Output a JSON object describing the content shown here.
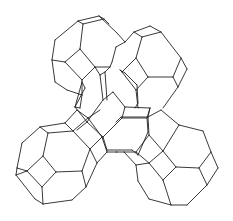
{
  "diagram": {
    "type": "line-drawing",
    "stroke_color": "#222222",
    "background": "#ffffff",
    "cages": [
      {
        "name": "top-left-cage",
        "position": "top-left"
      },
      {
        "name": "top-right-cage",
        "position": "top-right"
      },
      {
        "name": "bottom-left-cage",
        "position": "bottom-left"
      },
      {
        "name": "bottom-right-cage",
        "position": "bottom-right"
      }
    ],
    "segments": [
      [
        78,
        21,
        99,
        16
      ],
      [
        99,
        16,
        117,
        33
      ],
      [
        78,
        21,
        83,
        24
      ],
      [
        83,
        24,
        104,
        19
      ],
      [
        104,
        19,
        109,
        24
      ],
      [
        99,
        16,
        104,
        19
      ],
      [
        78,
        21,
        55,
        40
      ],
      [
        55,
        40,
        52,
        60
      ],
      [
        52,
        60,
        55,
        82
      ],
      [
        55,
        82,
        67,
        90
      ],
      [
        67,
        90,
        82,
        95
      ],
      [
        83,
        24,
        80,
        49
      ],
      [
        80,
        49,
        65,
        62
      ],
      [
        65,
        62,
        52,
        60
      ],
      [
        80,
        49,
        95,
        67
      ],
      [
        65,
        62,
        82,
        80
      ],
      [
        82,
        80,
        82,
        95
      ],
      [
        82,
        80,
        95,
        67
      ],
      [
        95,
        67,
        110,
        67
      ],
      [
        110,
        67,
        105,
        72
      ],
      [
        95,
        67,
        100,
        75
      ],
      [
        100,
        75,
        105,
        72
      ],
      [
        105,
        72,
        107,
        100
      ],
      [
        100,
        75,
        103,
        100
      ],
      [
        117,
        33,
        125,
        42
      ],
      [
        82,
        95,
        80,
        108
      ],
      [
        80,
        108,
        75,
        107
      ],
      [
        134,
        32,
        150,
        26
      ],
      [
        150,
        26,
        161,
        32
      ],
      [
        161,
        32,
        142,
        37
      ],
      [
        142,
        37,
        134,
        32
      ],
      [
        134,
        32,
        125,
        42
      ],
      [
        161,
        32,
        181,
        58
      ],
      [
        181,
        58,
        187,
        69
      ],
      [
        187,
        69,
        178,
        87
      ],
      [
        178,
        87,
        173,
        77
      ],
      [
        173,
        77,
        181,
        58
      ],
      [
        142,
        37,
        136,
        58
      ],
      [
        136,
        58,
        148,
        77
      ],
      [
        148,
        77,
        173,
        77
      ],
      [
        136,
        58,
        122,
        72
      ],
      [
        122,
        72,
        136,
        90
      ],
      [
        136,
        90,
        148,
        77
      ],
      [
        178,
        87,
        163,
        108
      ],
      [
        136,
        90,
        138,
        108
      ],
      [
        125,
        42,
        116,
        47
      ],
      [
        116,
        47,
        112,
        62
      ],
      [
        112,
        62,
        110,
        67
      ],
      [
        120,
        70,
        125,
        73
      ],
      [
        125,
        73,
        137,
        85
      ],
      [
        137,
        85,
        138,
        103
      ],
      [
        122,
        72,
        120,
        70
      ],
      [
        40,
        127,
        65,
        123
      ],
      [
        40,
        127,
        48,
        133
      ],
      [
        48,
        133,
        73,
        131
      ],
      [
        65,
        123,
        73,
        131
      ],
      [
        40,
        127,
        22,
        143
      ],
      [
        22,
        143,
        17,
        168
      ],
      [
        17,
        168,
        16,
        175
      ],
      [
        16,
        175,
        27,
        171
      ],
      [
        17,
        168,
        27,
        171
      ],
      [
        48,
        133,
        43,
        156
      ],
      [
        43,
        156,
        27,
        171
      ],
      [
        43,
        156,
        56,
        172
      ],
      [
        56,
        172,
        82,
        171
      ],
      [
        82,
        171,
        90,
        149
      ],
      [
        90,
        149,
        73,
        131
      ],
      [
        27,
        171,
        42,
        187
      ],
      [
        42,
        187,
        56,
        172
      ],
      [
        42,
        187,
        43,
        204
      ],
      [
        16,
        175,
        35,
        199
      ],
      [
        35,
        199,
        43,
        204
      ],
      [
        43,
        204,
        72,
        200
      ],
      [
        72,
        200,
        86,
        187
      ],
      [
        86,
        187,
        82,
        171
      ],
      [
        86,
        187,
        97,
        163
      ],
      [
        97,
        163,
        90,
        149
      ],
      [
        65,
        123,
        77,
        110
      ],
      [
        73,
        131,
        88,
        118
      ],
      [
        77,
        110,
        88,
        118
      ],
      [
        88,
        118,
        100,
        110
      ],
      [
        88,
        118,
        102,
        137
      ],
      [
        90,
        149,
        102,
        137
      ],
      [
        102,
        137,
        107,
        152
      ],
      [
        107,
        152,
        97,
        163
      ],
      [
        107,
        152,
        117,
        152
      ],
      [
        75,
        107,
        87,
        122
      ],
      [
        87,
        122,
        77,
        130
      ],
      [
        87,
        122,
        103,
        137
      ],
      [
        82,
        82,
        85,
        88
      ],
      [
        85,
        88,
        75,
        107
      ],
      [
        82,
        82,
        75,
        107
      ],
      [
        103,
        100,
        113,
        92
      ],
      [
        113,
        92,
        125,
        107
      ],
      [
        103,
        100,
        87,
        122
      ],
      [
        125,
        107,
        122,
        118
      ],
      [
        122,
        118,
        103,
        137
      ],
      [
        125,
        107,
        150,
        108
      ],
      [
        122,
        118,
        147,
        118
      ],
      [
        150,
        108,
        147,
        118
      ],
      [
        147,
        118,
        148,
        132
      ],
      [
        148,
        132,
        138,
        155
      ],
      [
        103,
        137,
        107,
        150
      ],
      [
        107,
        150,
        132,
        150
      ],
      [
        132,
        150,
        138,
        155
      ],
      [
        135,
        108,
        138,
        103
      ],
      [
        161,
        110,
        179,
        125
      ],
      [
        179,
        125,
        203,
        131
      ],
      [
        203,
        131,
        211,
        152
      ],
      [
        211,
        152,
        218,
        168
      ],
      [
        218,
        168,
        207,
        185
      ],
      [
        207,
        185,
        199,
        168
      ],
      [
        199,
        168,
        211,
        152
      ],
      [
        199,
        168,
        176,
        167
      ],
      [
        176,
        167,
        163,
        151
      ],
      [
        163,
        151,
        179,
        125
      ],
      [
        163,
        151,
        149,
        135
      ],
      [
        149,
        135,
        148,
        117
      ],
      [
        148,
        117,
        150,
        108
      ],
      [
        149,
        135,
        136,
        152
      ],
      [
        136,
        152,
        149,
        163
      ],
      [
        149,
        163,
        163,
        151
      ],
      [
        149,
        163,
        163,
        180
      ],
      [
        163,
        180,
        176,
        167
      ],
      [
        149,
        163,
        136,
        165
      ],
      [
        136,
        165,
        124,
        152
      ],
      [
        124,
        152,
        136,
        152
      ],
      [
        116,
        152,
        124,
        152
      ],
      [
        136,
        165,
        138,
        181
      ],
      [
        138,
        181,
        149,
        199
      ],
      [
        149,
        199,
        171,
        205
      ],
      [
        171,
        205,
        187,
        205
      ],
      [
        187,
        205,
        207,
        185
      ],
      [
        163,
        180,
        171,
        205
      ],
      [
        161,
        110,
        148,
        117
      ],
      [
        121,
        117,
        116,
        122
      ],
      [
        121,
        117,
        148,
        117
      ]
    ]
  }
}
